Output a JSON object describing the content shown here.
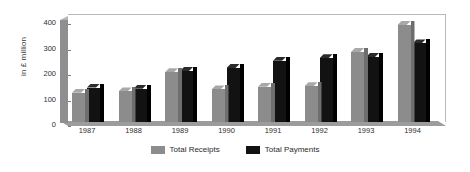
{
  "chart_data": {
    "type": "bar",
    "title": "",
    "subtitle": "",
    "xlabel": "",
    "ylabel": "in £ million",
    "categories": [
      "1987",
      "1988",
      "1989",
      "1990",
      "1991",
      "1992",
      "1993",
      "1994"
    ],
    "series": [
      {
        "name": "Total Receipts",
        "color": "#8c8c8c",
        "values": [
          115,
          120,
          195,
          128,
          138,
          140,
          275,
          380
        ]
      },
      {
        "name": "Total Payments",
        "color": "#121212",
        "values": [
          135,
          130,
          200,
          212,
          240,
          250,
          255,
          308
        ]
      }
    ],
    "ylim": [
      0,
      400
    ],
    "yticks": [
      0,
      100,
      200,
      300,
      400
    ],
    "ytick_labels": [
      "0",
      "100",
      "200",
      "300",
      "400"
    ],
    "grid": false,
    "legend_position": "bottom",
    "style": "3d-column"
  },
  "legend": {
    "items": [
      {
        "label": "Total Receipts",
        "swatch": "receipts"
      },
      {
        "label": "Total Payments",
        "swatch": "payments"
      }
    ]
  }
}
